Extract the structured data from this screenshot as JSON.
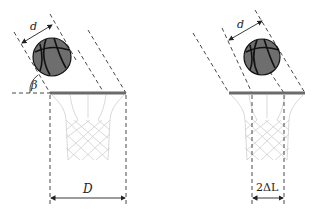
{
  "diagram": {
    "left_panel": {
      "ball_diameter_label": "d",
      "angle_label": "β",
      "hoop_width_label": "D"
    },
    "right_panel": {
      "ball_diameter_label": "d",
      "clearance_label": "2ΔL"
    },
    "colors": {
      "rim": "#6b6b6b",
      "ball": "#6e6e6e",
      "ball_lines": "#111111",
      "net": "#cfcfcf",
      "dashes": "#333333"
    }
  }
}
